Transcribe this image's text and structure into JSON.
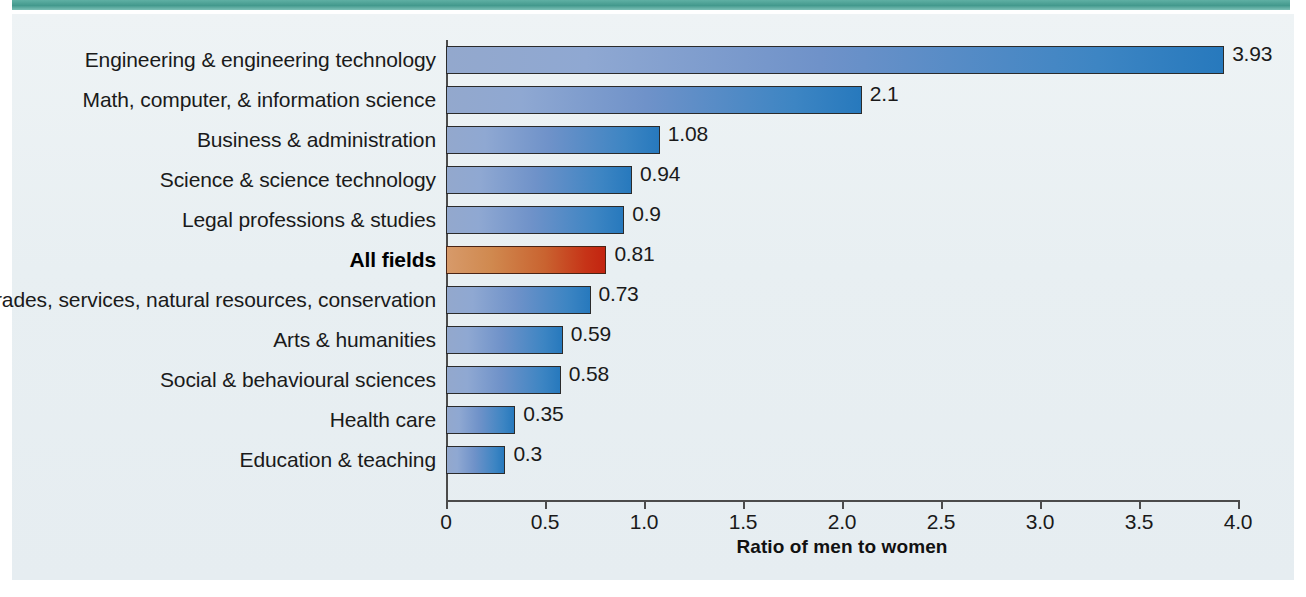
{
  "figure": {
    "accent_band_color": "#43998d",
    "panel_color": "#e9eff2",
    "bar_color_start": "#93a8cd",
    "bar_color_end": "#2779bd",
    "highlight_color_start": "#d79a6a",
    "highlight_color_end": "#c32410"
  },
  "chart_data": {
    "type": "bar",
    "orientation": "horizontal",
    "title": "",
    "xlabel": "Ratio of men to women",
    "ylabel": "",
    "xlim": [
      0,
      4.0
    ],
    "xticks": [
      "0",
      "0.5",
      "1.0",
      "1.5",
      "2.0",
      "2.5",
      "3.0",
      "3.5",
      "4.0"
    ],
    "xtick_values": [
      0,
      0.5,
      1.0,
      1.5,
      2.0,
      2.5,
      3.0,
      3.5,
      4.0
    ],
    "grid": false,
    "legend": false,
    "categories": [
      "Engineering & engineering technology",
      "Math, computer, & information science",
      "Business & administration",
      "Science & science technology",
      "Legal professions & studies",
      "All fields",
      "Trades, services, natural resources, conservation",
      "Arts & humanities",
      "Social & behavioural sciences",
      "Health care",
      "Education & teaching"
    ],
    "values": [
      3.93,
      2.1,
      1.08,
      0.94,
      0.9,
      0.81,
      0.73,
      0.59,
      0.58,
      0.35,
      0.3
    ],
    "value_labels": [
      "3.93",
      "2.1",
      "1.08",
      "0.94",
      "0.9",
      "0.81",
      "0.73",
      "0.59",
      "0.58",
      "0.35",
      "0.3"
    ],
    "highlight_index": 5,
    "highlight_label": "All fields"
  }
}
